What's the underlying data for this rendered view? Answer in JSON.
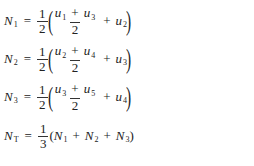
{
  "equations": [
    {
      "lhs": {
        "symbol": "N",
        "sub": "1"
      },
      "coef": {
        "num": "1",
        "den": "2"
      },
      "inner": {
        "a": {
          "symbol": "u",
          "sub": "1"
        },
        "b": {
          "symbol": "u",
          "sub": "3"
        },
        "den": "2",
        "c": {
          "symbol": "u",
          "sub": "2"
        }
      }
    },
    {
      "lhs": {
        "symbol": "N",
        "sub": "2"
      },
      "coef": {
        "num": "1",
        "den": "2"
      },
      "inner": {
        "a": {
          "symbol": "u",
          "sub": "2"
        },
        "b": {
          "symbol": "u",
          "sub": "4"
        },
        "den": "2",
        "c": {
          "symbol": "u",
          "sub": "3"
        }
      }
    },
    {
      "lhs": {
        "symbol": "N",
        "sub": "3"
      },
      "coef": {
        "num": "1",
        "den": "2"
      },
      "inner": {
        "a": {
          "symbol": "u",
          "sub": "3"
        },
        "b": {
          "symbol": "u",
          "sub": "5"
        },
        "den": "2",
        "c": {
          "symbol": "u",
          "sub": "4"
        }
      }
    }
  ],
  "total": {
    "lhs": {
      "symbol": "N",
      "sub": "T"
    },
    "coef": {
      "num": "1",
      "den": "3"
    },
    "terms": [
      {
        "symbol": "N",
        "sub": "1"
      },
      {
        "symbol": "N",
        "sub": "2"
      },
      {
        "symbol": "N",
        "sub": "3"
      }
    ]
  },
  "symbols": {
    "equals": "=",
    "plus": "+",
    "lparen": "(",
    "rparen": ")"
  }
}
